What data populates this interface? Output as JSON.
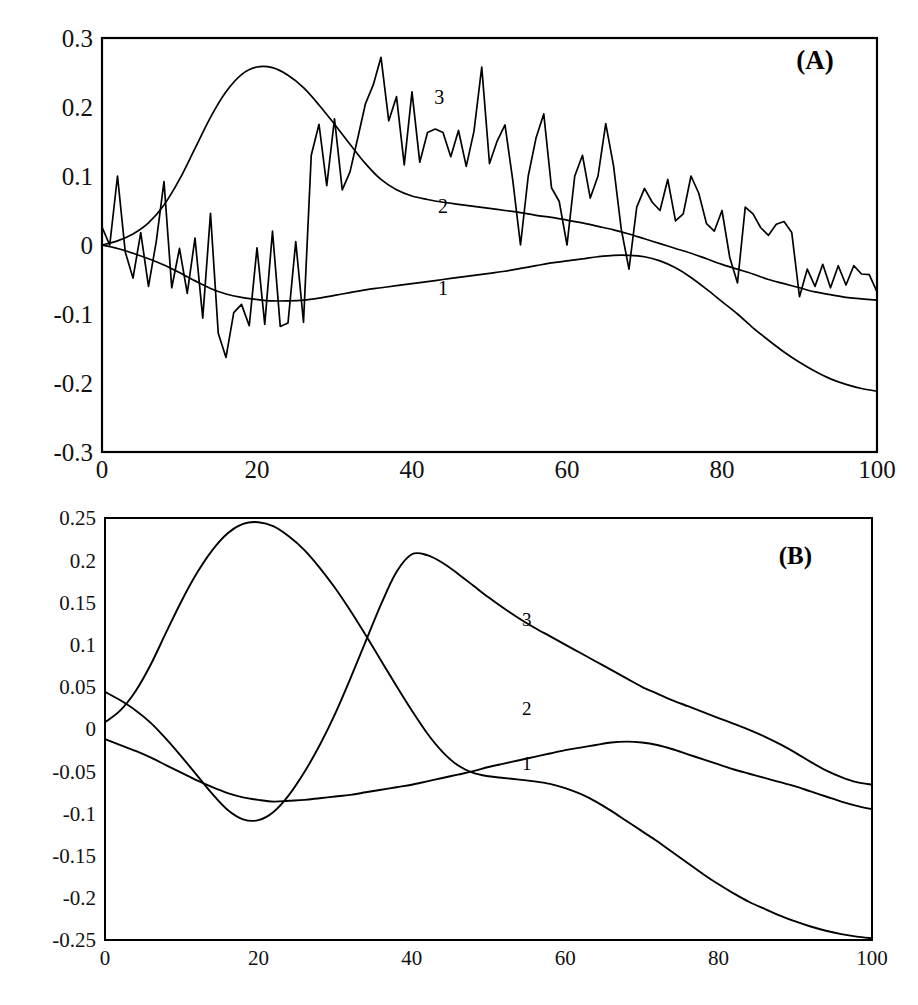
{
  "figure": {
    "name": "two-panel-line-chart",
    "background": "#ffffff",
    "line_color": "#000000",
    "panels": [
      "A",
      "B"
    ]
  },
  "chart_data": [
    {
      "type": "line",
      "panel_label": "(A)",
      "title": "",
      "subtitle": "",
      "xlabel": "",
      "ylabel": "",
      "grid": false,
      "legend_position": "inline-curve-labels",
      "xlim": [
        0,
        100
      ],
      "ylim": [
        -0.3,
        0.3
      ],
      "xticks": [
        0,
        20,
        40,
        60,
        80,
        100
      ],
      "xticklabels": [
        "0",
        "20",
        "40",
        "60",
        "80",
        "100"
      ],
      "yticks": [
        -0.3,
        -0.2,
        -0.1,
        0,
        0.1,
        0.2,
        0.3
      ],
      "yticklabels": [
        "-0.3",
        "-0.2",
        "-0.1",
        "0",
        "0.1",
        "0.2",
        "0.3"
      ],
      "annotations": [
        {
          "text": "(A)",
          "x": 92,
          "y": 0.255
        },
        {
          "text": "3",
          "x": 43.5,
          "y": 0.205
        },
        {
          "text": "2",
          "x": 44.0,
          "y": 0.046
        },
        {
          "text": "1",
          "x": 44.0,
          "y": -0.072
        }
      ],
      "series": [
        {
          "name": "1",
          "label": "1",
          "style": "smooth",
          "x": [
            0,
            2,
            4,
            6,
            8,
            10,
            12,
            14,
            16,
            18,
            20,
            22,
            24,
            26,
            28,
            30,
            32,
            34,
            36,
            38,
            40,
            42,
            44,
            46,
            48,
            50,
            52,
            54,
            56,
            58,
            60,
            62,
            64,
            66,
            68,
            70,
            72,
            74,
            76,
            78,
            80,
            82,
            84,
            86,
            88,
            90,
            92,
            94,
            96,
            98,
            100
          ],
          "values": [
            0.0,
            -0.005,
            -0.012,
            -0.02,
            -0.029,
            -0.04,
            -0.052,
            -0.063,
            -0.071,
            -0.076,
            -0.079,
            -0.081,
            -0.081,
            -0.08,
            -0.077,
            -0.073,
            -0.069,
            -0.065,
            -0.062,
            -0.059,
            -0.056,
            -0.053,
            -0.05,
            -0.047,
            -0.044,
            -0.041,
            -0.038,
            -0.034,
            -0.03,
            -0.026,
            -0.023,
            -0.02,
            -0.017,
            -0.015,
            -0.015,
            -0.017,
            -0.023,
            -0.033,
            -0.047,
            -0.064,
            -0.082,
            -0.1,
            -0.12,
            -0.138,
            -0.155,
            -0.17,
            -0.183,
            -0.194,
            -0.202,
            -0.208,
            -0.212
          ]
        },
        {
          "name": "2",
          "label": "2",
          "style": "smooth",
          "x": [
            0,
            2,
            4,
            6,
            8,
            10,
            12,
            14,
            16,
            18,
            20,
            22,
            24,
            26,
            28,
            30,
            32,
            34,
            36,
            38,
            40,
            42,
            44,
            46,
            48,
            50,
            52,
            54,
            56,
            58,
            60,
            62,
            64,
            66,
            68,
            70,
            72,
            74,
            76,
            78,
            80,
            82,
            84,
            86,
            88,
            90,
            92,
            94,
            96,
            98,
            100
          ],
          "values": [
            0.0,
            0.006,
            0.016,
            0.032,
            0.058,
            0.095,
            0.14,
            0.185,
            0.222,
            0.247,
            0.258,
            0.257,
            0.246,
            0.228,
            0.203,
            0.175,
            0.146,
            0.118,
            0.095,
            0.08,
            0.071,
            0.066,
            0.062,
            0.059,
            0.056,
            0.053,
            0.05,
            0.047,
            0.043,
            0.04,
            0.036,
            0.032,
            0.027,
            0.022,
            0.016,
            0.009,
            0.002,
            -0.005,
            -0.012,
            -0.02,
            -0.028,
            -0.035,
            -0.042,
            -0.05,
            -0.056,
            -0.062,
            -0.068,
            -0.072,
            -0.076,
            -0.078,
            -0.08
          ]
        },
        {
          "name": "3",
          "label": "3",
          "style": "jagged",
          "x": [
            0,
            1,
            2,
            3,
            4,
            5,
            6,
            7,
            8,
            9,
            10,
            11,
            12,
            13,
            14,
            15,
            16,
            17,
            18,
            19,
            20,
            21,
            22,
            23,
            24,
            25,
            26,
            27,
            28,
            29,
            30,
            31,
            32,
            33,
            34,
            35,
            36,
            37,
            38,
            39,
            40,
            41,
            42,
            43,
            44,
            45,
            46,
            47,
            48,
            49,
            50,
            51,
            52,
            53,
            54,
            55,
            56,
            57,
            58,
            59,
            60,
            61,
            62,
            63,
            64,
            65,
            66,
            67,
            68,
            69,
            70,
            71,
            72,
            73,
            74,
            75,
            76,
            77,
            78,
            79,
            80,
            81,
            82,
            83,
            84,
            85,
            86,
            87,
            88,
            89,
            90,
            91,
            92,
            93,
            94,
            95,
            96,
            97,
            98,
            99,
            100
          ],
          "values": [
            0.026,
            0.0,
            0.1,
            -0.01,
            -0.048,
            0.018,
            -0.06,
            0.005,
            0.092,
            -0.062,
            -0.005,
            -0.07,
            0.01,
            -0.106,
            0.046,
            -0.128,
            -0.163,
            -0.098,
            -0.086,
            -0.117,
            -0.004,
            -0.115,
            0.02,
            -0.118,
            -0.113,
            0.005,
            -0.112,
            0.13,
            0.175,
            0.086,
            0.183,
            0.08,
            0.106,
            0.155,
            0.205,
            0.232,
            0.272,
            0.18,
            0.215,
            0.116,
            0.222,
            0.12,
            0.163,
            0.168,
            0.163,
            0.128,
            0.166,
            0.114,
            0.165,
            0.258,
            0.118,
            0.151,
            0.174,
            0.094,
            0.0,
            0.1,
            0.155,
            0.19,
            0.083,
            0.063,
            0.0,
            0.1,
            0.13,
            0.068,
            0.1,
            0.176,
            0.115,
            0.023,
            -0.035,
            0.055,
            0.082,
            0.062,
            0.05,
            0.095,
            0.035,
            0.045,
            0.1,
            0.075,
            0.031,
            0.02,
            0.05,
            -0.018,
            -0.055,
            0.055,
            0.045,
            0.025,
            0.014,
            0.03,
            0.034,
            0.018,
            -0.075,
            -0.035,
            -0.06,
            -0.028,
            -0.062,
            -0.03,
            -0.058,
            -0.03,
            -0.042,
            -0.043,
            -0.068
          ]
        }
      ]
    },
    {
      "type": "line",
      "panel_label": "(B)",
      "title": "",
      "subtitle": "",
      "xlabel": "",
      "ylabel": "",
      "grid": false,
      "legend_position": "inline-curve-labels",
      "xlim": [
        0,
        100
      ],
      "ylim": [
        -0.25,
        0.25
      ],
      "xticks": [
        0,
        20,
        40,
        60,
        80,
        100
      ],
      "xticklabels": [
        "0",
        "20",
        "40",
        "60",
        "80",
        "100"
      ],
      "yticks": [
        -0.25,
        -0.2,
        -0.15,
        -0.1,
        -0.05,
        0,
        0.05,
        0.1,
        0.15,
        0.2,
        0.25
      ],
      "yticklabels": [
        "-0.25",
        "-0.2",
        "-0.15",
        "-0.1",
        "-0.05",
        "0",
        "0.05",
        "0.1",
        "0.15",
        "0.2",
        "0.25"
      ],
      "annotations": [
        {
          "text": "(B)",
          "x": 90,
          "y": 0.195
        },
        {
          "text": "3",
          "x": 55,
          "y": 0.122
        },
        {
          "text": "2",
          "x": 55,
          "y": 0.017
        },
        {
          "text": "1",
          "x": 55,
          "y": -0.048
        }
      ],
      "series": [
        {
          "name": "1",
          "label": "1",
          "style": "smooth",
          "x": [
            0,
            2,
            4,
            6,
            8,
            10,
            12,
            14,
            16,
            18,
            20,
            22,
            24,
            26,
            28,
            30,
            32,
            34,
            36,
            38,
            40,
            42,
            44,
            46,
            48,
            50,
            52,
            54,
            56,
            58,
            60,
            62,
            64,
            66,
            68,
            70,
            72,
            74,
            76,
            78,
            80,
            82,
            84,
            86,
            88,
            90,
            92,
            94,
            96,
            98,
            100
          ],
          "values": [
            -0.012,
            -0.019,
            -0.026,
            -0.034,
            -0.043,
            -0.052,
            -0.061,
            -0.069,
            -0.076,
            -0.081,
            -0.084,
            -0.086,
            -0.085,
            -0.084,
            -0.082,
            -0.08,
            -0.078,
            -0.075,
            -0.072,
            -0.069,
            -0.066,
            -0.062,
            -0.058,
            -0.054,
            -0.05,
            -0.045,
            -0.041,
            -0.037,
            -0.033,
            -0.029,
            -0.025,
            -0.022,
            -0.019,
            -0.016,
            -0.015,
            -0.016,
            -0.019,
            -0.024,
            -0.03,
            -0.036,
            -0.042,
            -0.048,
            -0.053,
            -0.058,
            -0.063,
            -0.068,
            -0.074,
            -0.08,
            -0.086,
            -0.091,
            -0.095
          ]
        },
        {
          "name": "2",
          "label": "2",
          "style": "smooth",
          "x": [
            0,
            2,
            4,
            6,
            8,
            10,
            12,
            14,
            16,
            18,
            20,
            22,
            24,
            26,
            28,
            30,
            32,
            34,
            36,
            38,
            40,
            42,
            44,
            46,
            48,
            50,
            52,
            54,
            56,
            58,
            60,
            62,
            64,
            66,
            68,
            70,
            72,
            74,
            76,
            78,
            80,
            82,
            84,
            86,
            88,
            90,
            92,
            94,
            96,
            98,
            100
          ],
          "values": [
            0.044,
            0.034,
            0.022,
            0.007,
            -0.012,
            -0.033,
            -0.055,
            -0.077,
            -0.096,
            -0.107,
            -0.108,
            -0.098,
            -0.078,
            -0.051,
            -0.019,
            0.018,
            0.06,
            0.104,
            0.148,
            0.186,
            0.207,
            0.206,
            0.197,
            0.184,
            0.17,
            0.156,
            0.143,
            0.131,
            0.12,
            0.11,
            0.1,
            0.09,
            0.08,
            0.07,
            0.06,
            0.05,
            0.042,
            0.034,
            0.027,
            0.02,
            0.013,
            0.006,
            -0.001,
            -0.009,
            -0.018,
            -0.028,
            -0.039,
            -0.049,
            -0.057,
            -0.063,
            -0.066
          ]
        },
        {
          "name": "3",
          "label": "3",
          "style": "smooth",
          "x": [
            0,
            2,
            4,
            6,
            8,
            10,
            12,
            14,
            16,
            18,
            20,
            22,
            24,
            26,
            28,
            30,
            32,
            34,
            36,
            38,
            40,
            42,
            44,
            46,
            48,
            50,
            52,
            54,
            56,
            58,
            60,
            62,
            64,
            66,
            68,
            70,
            72,
            74,
            76,
            78,
            80,
            82,
            84,
            86,
            88,
            90,
            92,
            94,
            96,
            98,
            100
          ],
          "values": [
            0.008,
            0.022,
            0.045,
            0.077,
            0.115,
            0.152,
            0.185,
            0.212,
            0.232,
            0.243,
            0.245,
            0.24,
            0.228,
            0.212,
            0.191,
            0.167,
            0.14,
            0.111,
            0.081,
            0.051,
            0.022,
            -0.005,
            -0.027,
            -0.043,
            -0.052,
            -0.056,
            -0.058,
            -0.06,
            -0.062,
            -0.065,
            -0.07,
            -0.077,
            -0.086,
            -0.097,
            -0.109,
            -0.121,
            -0.133,
            -0.146,
            -0.159,
            -0.172,
            -0.184,
            -0.195,
            -0.205,
            -0.213,
            -0.221,
            -0.228,
            -0.234,
            -0.239,
            -0.243,
            -0.246,
            -0.248
          ]
        }
      ]
    }
  ]
}
